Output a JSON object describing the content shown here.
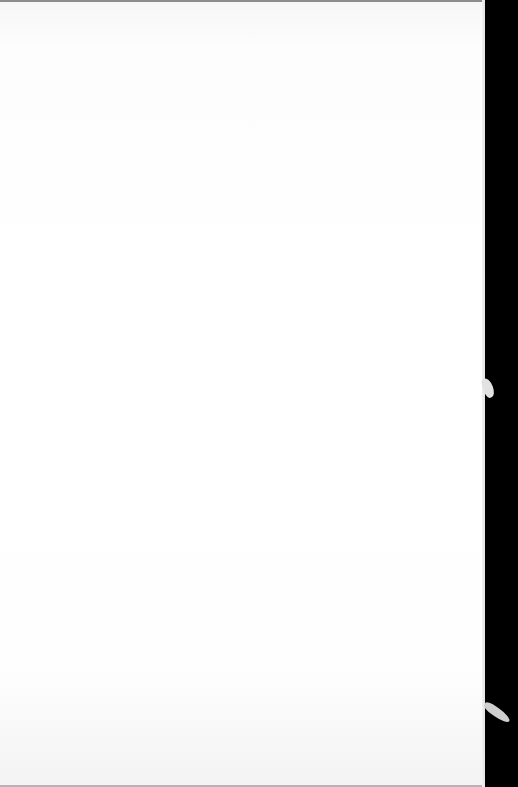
{
  "scene": {
    "description": "Photograph of a blank white sheet of paper against a black background",
    "colors": {
      "paper": "#ffffff",
      "background": "#000000",
      "edge_shadow": "#8c8c8c"
    }
  }
}
